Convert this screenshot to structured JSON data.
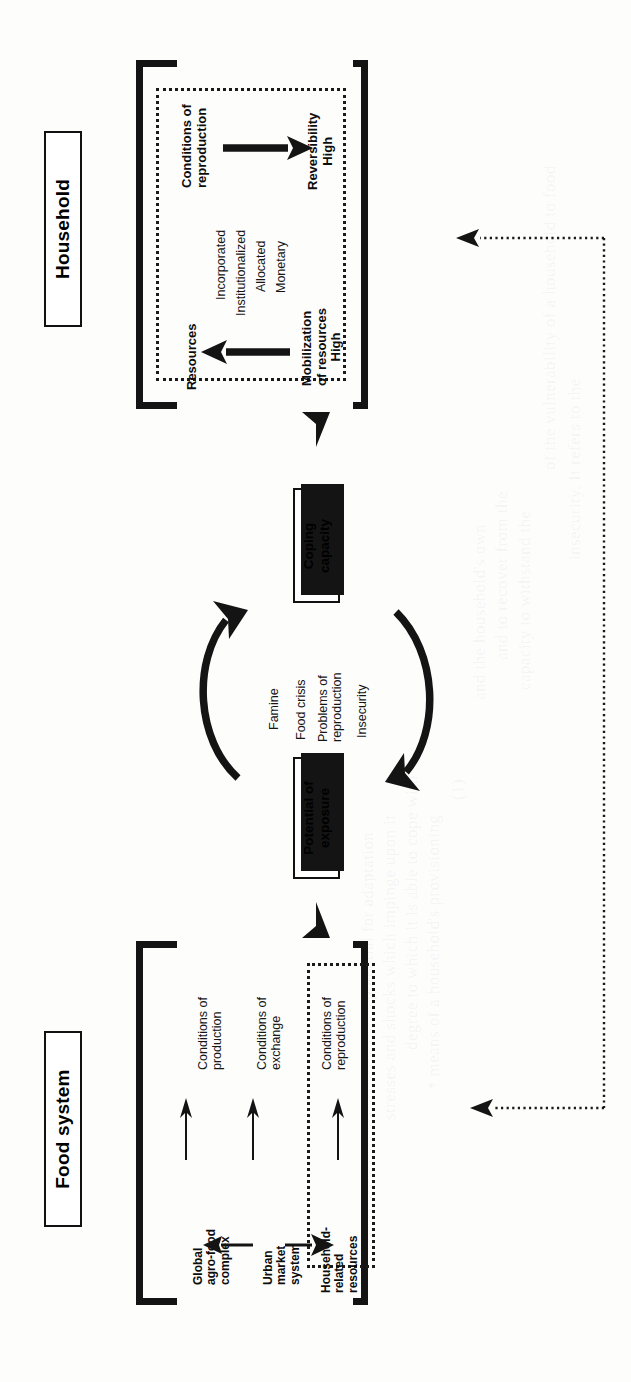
{
  "figure": {
    "orientation": "rotated-90-ccw",
    "ink_color": "#141414",
    "paper_color": "#fdfdfc"
  },
  "sections": {
    "household": {
      "title": "Household",
      "flow_top_label": "Conditions of\nreproduction",
      "flow_top_label_line1": "Conditions of",
      "flow_top_label_line2": "reproduction",
      "flow_top_target_line1": "Reversibility",
      "flow_top_target_line2": "High",
      "flow_bottom_label": "Resources",
      "flow_bottom_target_line1": "Mobilization",
      "flow_bottom_target_line2": "of resources",
      "flow_bottom_target_line3": "High",
      "resource_types": [
        "Incorporated",
        "Institutionalized",
        "Allocated",
        "Monetary"
      ]
    },
    "middle": {
      "box_top_line1": "Coping",
      "box_top_line2": "capacity",
      "box_bottom_line1": "Potential of",
      "box_bottom_line2": "exposure",
      "crisis_labels": [
        "Famine",
        "Food crisis",
        "Problems of",
        "reproduction",
        "Insecurity"
      ],
      "crisis_label_groups": [
        {
          "text": "Famine"
        },
        {
          "text": "Food crisis"
        },
        {
          "line1": "Problems of",
          "line2": "reproduction"
        },
        {
          "text": "Insecurity"
        }
      ]
    },
    "food_system": {
      "title": "Food system",
      "conditions": [
        {
          "line1": "Conditions of",
          "line2": "production"
        },
        {
          "line1": "Conditions of",
          "line2": "exchange"
        },
        {
          "line1": "Conditions of",
          "line2": "reproduction"
        }
      ],
      "actors": [
        {
          "line1": "Global",
          "line2": "agro-food",
          "line3": "complex"
        },
        {
          "line1": "Urban",
          "line2": "market",
          "line3": "system"
        },
        {
          "line1": "Household-",
          "line2": "related",
          "line3": "resources"
        }
      ]
    }
  },
  "ghost_text": [
    "of the vulnerability of a household to food",
    "insecurity. It refers to the",
    "capacity to withstand the",
    "and to recover from the",
    "and the household's own",
    "(1)",
    "* means of a household's provisioning",
    "degree to which it is able to cope with",
    "stresses and shocks which impinge upon it",
    "potential for adaptation"
  ]
}
